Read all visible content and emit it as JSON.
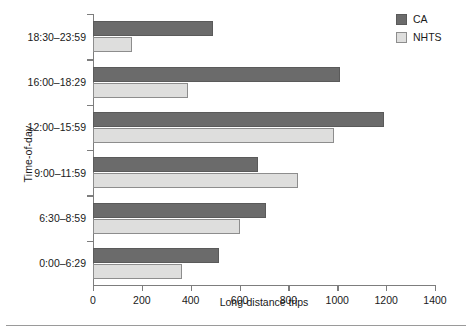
{
  "chart_data": {
    "type": "bar",
    "orientation": "horizontal",
    "title": "",
    "xlabel": "Long-distance trips",
    "ylabel": "Time-of-day",
    "categories": [
      "0:00–6:29",
      "6:30–8:59",
      "9:00–11:59",
      "12:00–15:59",
      "16:00–18:29",
      "18:30–23:59"
    ],
    "series": [
      {
        "name": "CA",
        "color": "#6b6b6b",
        "values": [
          515,
          710,
          675,
          1190,
          1010,
          490
        ]
      },
      {
        "name": "NHTS",
        "color": "#dededd",
        "values": [
          365,
          600,
          840,
          985,
          390,
          160
        ]
      }
    ],
    "xlim": [
      0,
      1400
    ],
    "xticks": [
      0,
      200,
      400,
      600,
      800,
      1000,
      1200,
      1400
    ],
    "xtick_labels": [
      "0",
      "200",
      "400",
      "600",
      "800",
      "1000",
      "1200",
      "1400"
    ],
    "grid": false,
    "legend": {
      "position": "top-right",
      "entries": [
        {
          "label": "CA",
          "swatch": "dark-gray-swatch"
        },
        {
          "label": "NHTS",
          "swatch": "light-gray-swatch"
        }
      ]
    }
  }
}
